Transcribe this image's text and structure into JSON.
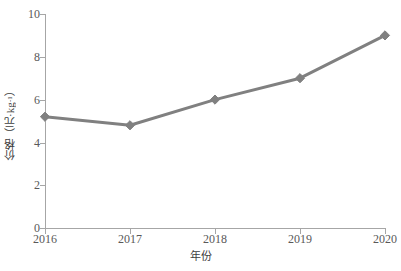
{
  "chart_data": {
    "type": "line",
    "title": "",
    "subtitle": "",
    "xlabel": "年份",
    "ylabel": "价格（元·kg-1）",
    "ylabel_base": "价格（元·kg",
    "ylabel_sup": "-1",
    "ylabel_tail": "）",
    "categories": [
      "2016",
      "2017",
      "2018",
      "2019",
      "2020"
    ],
    "x": [
      2016,
      2017,
      2018,
      2019,
      2020
    ],
    "values": [
      5.2,
      4.8,
      6.0,
      7.0,
      9.0
    ],
    "series": [
      {
        "name": "价格",
        "values": [
          5.2,
          4.8,
          6.0,
          7.0,
          9.0
        ]
      }
    ],
    "ylim": [
      0,
      10
    ],
    "yticks": [
      0,
      2,
      4,
      6,
      8,
      10
    ],
    "ytick_labels": [
      "0",
      "2",
      "4",
      "6",
      "8",
      "10"
    ],
    "xtick_labels": [
      "2016",
      "2017",
      "2018",
      "2019",
      "2020"
    ],
    "grid": false,
    "legend": false,
    "legend_position": "none",
    "marker": "diamond",
    "line_color": "#808080",
    "marker_color": "#808080",
    "axis_color": "#a6a6a6",
    "text_color": "#595959",
    "background": "#ffffff"
  }
}
